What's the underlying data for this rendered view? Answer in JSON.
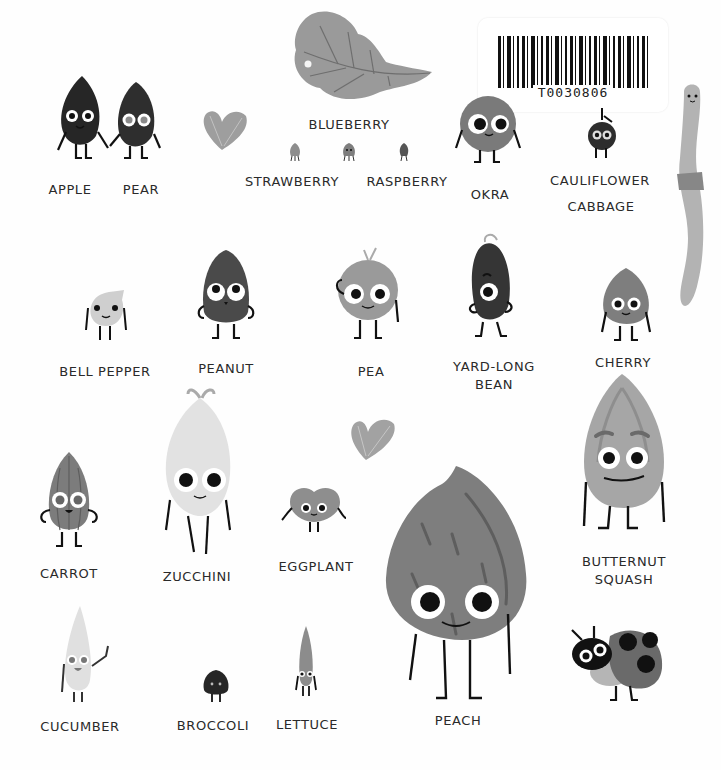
{
  "page": {
    "type": "picture-book-spread",
    "palette": {
      "background": "#fefefe",
      "ink": "#1a1a1a",
      "dark_char": "#2b2b2b",
      "mid_gray": "#7d7d7d",
      "light_gray": "#a9a9a9",
      "pale": "#dcdcdc",
      "label_text": "#2a2a2a"
    }
  },
  "barcode": {
    "code": "T0030806",
    "icon": "barcode-icon"
  },
  "decorations": {
    "leaf": "leaf-icon",
    "heart_top": "leaf-heart-icon",
    "heart_middle": "leaf-heart-icon",
    "worm": "worm-icon",
    "ladybug": "ladybug-icon"
  },
  "characters": [
    {
      "id": "apple",
      "label": "APPLE"
    },
    {
      "id": "pear",
      "label": "PEAR"
    },
    {
      "id": "blueberry",
      "label": "BLUEBERRY"
    },
    {
      "id": "strawberry",
      "label": "STRAWBERRY"
    },
    {
      "id": "raspberry",
      "label": "RASPBERRY"
    },
    {
      "id": "okra",
      "label": "OKRA"
    },
    {
      "id": "cauliflower",
      "label": "CAULIFLOWER"
    },
    {
      "id": "cabbage",
      "label": "CABBAGE"
    },
    {
      "id": "bell-pepper",
      "label": "BELL PEPPER"
    },
    {
      "id": "peanut",
      "label": "PEANUT"
    },
    {
      "id": "pea",
      "label": "PEA"
    },
    {
      "id": "yard-long-bean",
      "label_line1": "YARD-LONG",
      "label_line2": "BEAN"
    },
    {
      "id": "cherry",
      "label": "CHERRY"
    },
    {
      "id": "carrot",
      "label": "CARROT"
    },
    {
      "id": "zucchini",
      "label": "ZUCCHINI"
    },
    {
      "id": "eggplant",
      "label": "EGGPLANT"
    },
    {
      "id": "butternut-squash",
      "label_line1": "BUTTERNUT",
      "label_line2": "SQUASH"
    },
    {
      "id": "cucumber",
      "label": "CUCUMBER"
    },
    {
      "id": "broccoli",
      "label": "BROCCOLI"
    },
    {
      "id": "lettuce",
      "label": "LETTUCE"
    },
    {
      "id": "peach",
      "label": "PEACH"
    }
  ]
}
